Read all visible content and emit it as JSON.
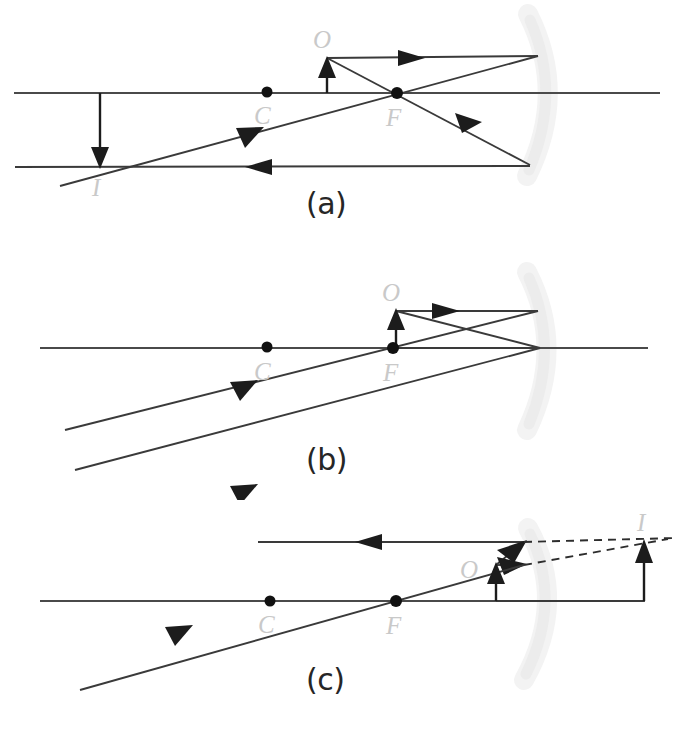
{
  "figure": {
    "type": "optics-ray-diagram",
    "background_color": "#ffffff",
    "ray_color": "#3a3a3a",
    "label_color": "#c9c9c9",
    "panel_label_color": "#262626",
    "mirror_color": "#ececec"
  },
  "panels": [
    {
      "id": "a",
      "label": "(a)",
      "label_pos": {
        "x": 306,
        "y": 186
      },
      "description": "Object beyond C: real, inverted, diminished image between F and C",
      "axis": {
        "x1": 14,
        "y1": 93,
        "x2": 660,
        "y2": 93
      },
      "mirror": {
        "cx": 556,
        "cy": 93,
        "top_x": 528,
        "top_y": 14,
        "bot_x": 527,
        "bot_y": 176
      },
      "points": [
        {
          "name": "C",
          "label": "C",
          "x": 267,
          "y": 92,
          "label_x": 254,
          "label_y": 124
        },
        {
          "name": "F",
          "label": "F",
          "x": 397,
          "y": 93,
          "label_x": 386,
          "label_y": 126
        }
      ],
      "object": {
        "label": "O",
        "x": 327,
        "base_y": 93,
        "tip_y": 59,
        "label_x": 313,
        "label_y": 48
      },
      "image": {
        "label": "I",
        "x": 100,
        "base_y": 93,
        "tip_y": 166,
        "label_x": 92,
        "label_y": 196
      }
    },
    {
      "id": "b",
      "label": "(b)",
      "label_pos": {
        "x": 306,
        "y": 442
      },
      "description": "Object at F: reflected rays emerge parallel, no image formed",
      "axis": {
        "x1": 40,
        "y1": 348,
        "x2": 648,
        "y2": 348
      },
      "mirror": {
        "cx": 553,
        "cy": 348,
        "top_x": 527,
        "top_y": 272,
        "bot_x": 527,
        "bot_y": 430
      },
      "points": [
        {
          "name": "C",
          "label": "C",
          "x": 267,
          "y": 347,
          "label_x": 254,
          "label_y": 380
        },
        {
          "name": "F",
          "label": "F",
          "x": 393,
          "y": 348,
          "label_x": 383,
          "label_y": 381
        }
      ],
      "object": {
        "label": "O",
        "x": 396,
        "base_y": 348,
        "tip_y": 311,
        "label_x": 382,
        "label_y": 301
      },
      "image": null
    },
    {
      "id": "c",
      "label": "(c)",
      "label_pos": {
        "x": 306,
        "y": 662
      },
      "description": "Object between F and mirror: virtual, upright, magnified image behind mirror",
      "axis": {
        "x1": 40,
        "y1": 601,
        "x2": 645,
        "y2": 601
      },
      "mirror": {
        "cx": 553,
        "cy": 601,
        "top_x": 528,
        "top_y": 528,
        "bot_x": 524,
        "bot_y": 680
      },
      "points": [
        {
          "name": "C",
          "label": "C",
          "x": 270,
          "y": 601,
          "label_x": 258,
          "label_y": 633
        },
        {
          "name": "F",
          "label": "F",
          "x": 396,
          "y": 601,
          "label_x": 386,
          "label_y": 634
        }
      ],
      "object": {
        "label": "O",
        "x": 496,
        "base_y": 601,
        "tip_y": 565,
        "label_x": 460,
        "label_y": 578
      },
      "image": {
        "label": "I",
        "x": 644,
        "base_y": 601,
        "tip_y": 542,
        "label_x": 637,
        "label_y": 531,
        "virtual": true
      }
    }
  ],
  "legend_terms": {
    "C": "center of curvature",
    "F": "focal point",
    "O": "object",
    "I": "image"
  }
}
